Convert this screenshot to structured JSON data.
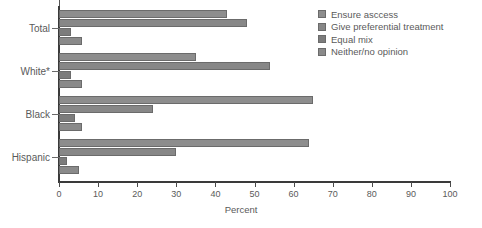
{
  "chart_data": {
    "type": "bar",
    "orientation": "horizontal",
    "title": "",
    "xlabel": "Percent",
    "ylabel": "",
    "xlim": [
      0,
      100
    ],
    "xticks": [
      0,
      10,
      20,
      30,
      40,
      50,
      60,
      70,
      80,
      90,
      100
    ],
    "grid": false,
    "legend_position": "top-right",
    "categories": [
      "Total",
      "White*",
      "Black",
      "Hispanic"
    ],
    "series": [
      {
        "name": "Ensure asccess",
        "color": "#8d8d8d",
        "values": [
          43,
          35,
          65,
          64
        ]
      },
      {
        "name": "Give preferential treatment",
        "color": "#878787",
        "values": [
          48,
          54,
          24,
          30
        ]
      },
      {
        "name": "Equal mix",
        "color": "#7c7c7c",
        "values": [
          3,
          3,
          4,
          2
        ]
      },
      {
        "name": "Neither/no opinion",
        "color": "#8a8a8a",
        "values": [
          6,
          6,
          6,
          5
        ]
      }
    ]
  },
  "axis": {
    "x_label": "Percent",
    "tick_labels": [
      "0",
      "10",
      "20",
      "30",
      "40",
      "50",
      "60",
      "70",
      "80",
      "90",
      "100"
    ],
    "category_labels": [
      "Total",
      "White*",
      "Black",
      "Hispanic"
    ]
  },
  "legend": {
    "items": [
      {
        "label": "Ensure asccess"
      },
      {
        "label": "Give preferential treatment"
      },
      {
        "label": "Equal mix"
      },
      {
        "label": "Neither/no opinion"
      }
    ]
  }
}
